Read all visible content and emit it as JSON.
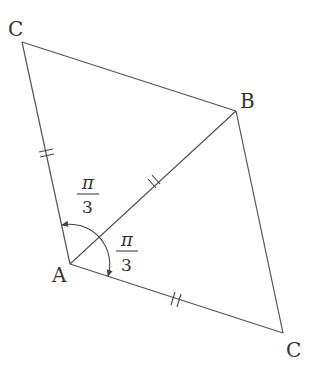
{
  "diagram": {
    "type": "geometry",
    "vertices": {
      "A": {
        "label": "A",
        "x": 70,
        "y": 264
      },
      "B": {
        "label": "B",
        "x": 236,
        "y": 111
      },
      "C_top": {
        "label": "C",
        "x": 22,
        "y": 42
      },
      "C_bottom": {
        "label": "C",
        "x": 283,
        "y": 333
      }
    },
    "edges": [
      {
        "from": "A",
        "to": "C_top",
        "equal_mark": "double"
      },
      {
        "from": "A",
        "to": "B",
        "equal_mark": "double"
      },
      {
        "from": "A",
        "to": "C_bottom",
        "equal_mark": "double"
      },
      {
        "from": "C_top",
        "to": "B",
        "equal_mark": "none"
      },
      {
        "from": "B",
        "to": "C_bottom",
        "equal_mark": "none"
      }
    ],
    "angles": [
      {
        "label_numerator": "π",
        "label_denominator": "3",
        "position": "upper-left"
      },
      {
        "label_numerator": "π",
        "label_denominator": "3",
        "position": "lower-right"
      }
    ],
    "labels": {
      "A": "A",
      "B": "B",
      "C_top": "C",
      "C_bottom": "C"
    },
    "colors": {
      "line": "#555555",
      "text": "#333333",
      "background": "#ffffff"
    }
  }
}
